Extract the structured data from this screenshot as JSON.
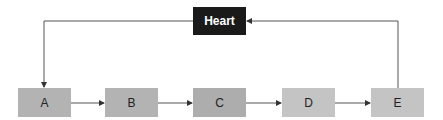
{
  "diagram": {
    "hub": {
      "label": "Heart",
      "color": "#1a1a1a",
      "text_color": "#ffffff"
    },
    "nodes": [
      {
        "label": "A",
        "color": "#b3b3b3"
      },
      {
        "label": "B",
        "color": "#b3b3b3"
      },
      {
        "label": "C",
        "color": "#adadad"
      },
      {
        "label": "D",
        "color": "#c4c4c4"
      },
      {
        "label": "E",
        "color": "#c4c4c4"
      }
    ],
    "edges": [
      {
        "from": "Heart",
        "to": "A"
      },
      {
        "from": "A",
        "to": "B"
      },
      {
        "from": "B",
        "to": "C"
      },
      {
        "from": "C",
        "to": "D"
      },
      {
        "from": "D",
        "to": "E"
      },
      {
        "from": "E",
        "to": "Heart"
      }
    ]
  }
}
